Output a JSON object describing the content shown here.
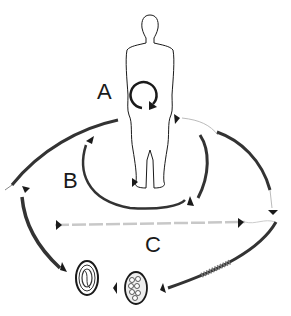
{
  "diagram": {
    "type": "life-cycle",
    "labels": {
      "a": "A",
      "b": "B",
      "c": "C"
    },
    "elements": [
      {
        "id": "human-host",
        "description": "human figure silhouette"
      },
      {
        "id": "autoinfection-cycle",
        "description": "circular arrow within abdomen"
      },
      {
        "id": "egg-embryonated",
        "description": "egg containing coiled larva"
      },
      {
        "id": "egg-morula",
        "description": "egg containing cells"
      },
      {
        "id": "rhabditiform-larva"
      },
      {
        "id": "filariform-larva"
      },
      {
        "id": "free-living-adults"
      }
    ],
    "colors": {
      "ink": "#1a1a1a",
      "light": "#bbbbbb",
      "background": "#ffffff"
    }
  }
}
